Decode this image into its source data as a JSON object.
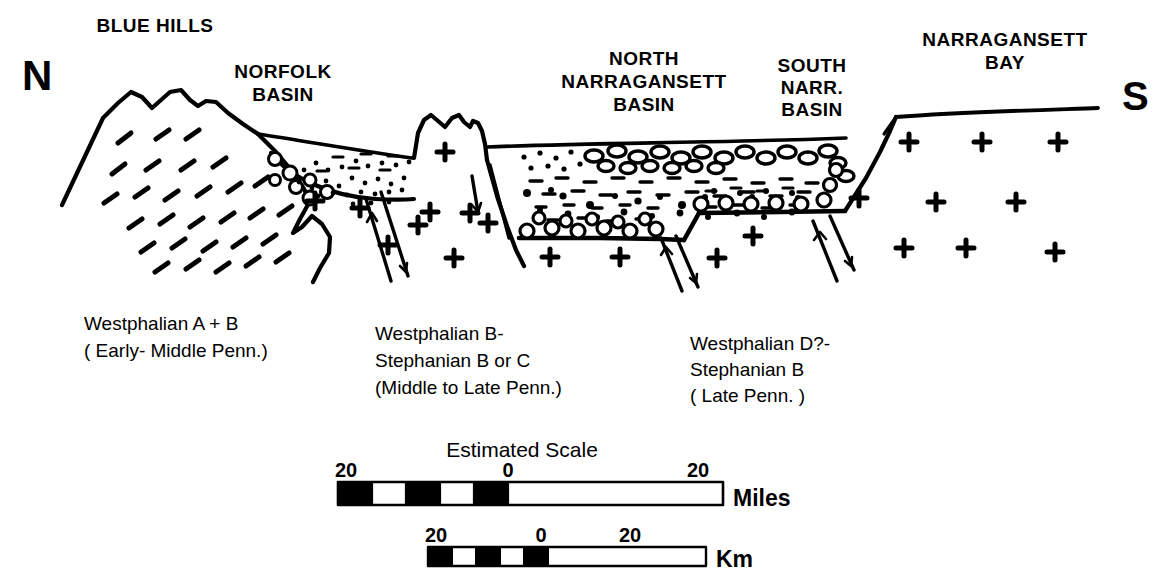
{
  "figure": {
    "kind": "geologic-cross-section",
    "orientation_labels": {
      "north": "N",
      "south": "S"
    },
    "ink_color": "#000000",
    "background_color": "#ffffff"
  },
  "section_labels": [
    {
      "id": "blue-hills",
      "lines": [
        "BLUE HILLS"
      ],
      "x": 155,
      "y": 32
    },
    {
      "id": "norfolk-basin",
      "lines": [
        "NORFOLK",
        "BASIN"
      ],
      "x": 283,
      "y": 78
    },
    {
      "id": "north-narr-basin",
      "lines": [
        "NORTH",
        "NARRAGANSETT",
        "BASIN"
      ],
      "x": 644,
      "y": 65
    },
    {
      "id": "south-narr-basin",
      "lines": [
        "SOUTH",
        "NARR.",
        "BASIN"
      ],
      "x": 812,
      "y": 72
    },
    {
      "id": "narragansett-bay",
      "lines": [
        "NARRAGANSETT",
        "BAY"
      ],
      "x": 1005,
      "y": 46
    }
  ],
  "age_captions": [
    {
      "id": "norfolk-age",
      "x": 84,
      "y": 330,
      "lines": [
        "Westphalian A + B",
        "( Early- Middle Penn.)"
      ]
    },
    {
      "id": "north-narr-age",
      "x": 375,
      "y": 340,
      "lines": [
        "Westphalian B-",
        "Stephanian B or C",
        "(Middle to Late Penn.)"
      ]
    },
    {
      "id": "south-narr-age",
      "x": 690,
      "y": 350,
      "lines": [
        "Westphalian D?-",
        "Stephanian  B",
        "( Late Penn. )"
      ]
    }
  ],
  "scale": {
    "title": "Estimated Scale",
    "title_x": 522,
    "title_y": 457,
    "bars": [
      {
        "id": "miles-bar",
        "unit_label": "Miles",
        "x": 338,
        "y": 482,
        "width": 385,
        "height": 22,
        "zero_offset": 170,
        "segment_count": 5,
        "tick_labels": [
          {
            "text": "20",
            "x": 346,
            "y": 477
          },
          {
            "text": "0",
            "x": 508,
            "y": 477
          },
          {
            "text": "20",
            "x": 698,
            "y": 477
          }
        ],
        "unit_x": 733,
        "unit_y": 505
      },
      {
        "id": "km-bar",
        "unit_label": "Km",
        "x": 428,
        "y": 547,
        "width": 278,
        "height": 18,
        "zero_offset": 120,
        "segment_count": 5,
        "tick_labels": [
          {
            "text": "20",
            "x": 432,
            "y": 542
          },
          {
            "text": "0",
            "x": 541,
            "y": 542
          },
          {
            "text": "20",
            "x": 630,
            "y": 542
          }
        ],
        "unit_x": 716,
        "unit_y": 566
      }
    ]
  },
  "legend_keys": {
    "basement_symbol": "plus",
    "volcanic_symbol": "dash",
    "conglomerate_symbol": "open-circle",
    "sandstone_symbol": "dot",
    "shale_symbol": "dash"
  }
}
